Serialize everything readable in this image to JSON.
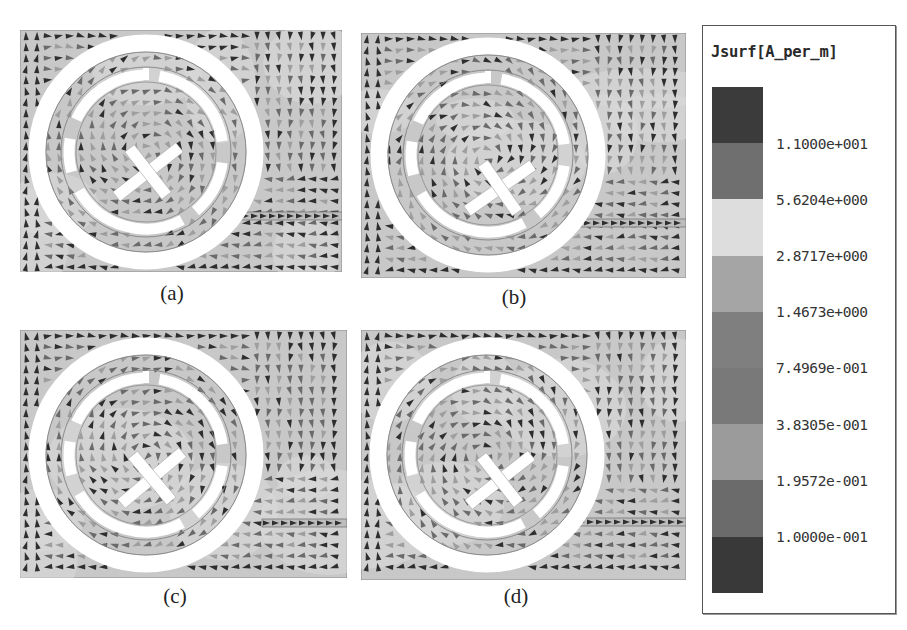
{
  "figure": {
    "panels": [
      {
        "id": "a",
        "caption": "(a)",
        "x": 20,
        "y": 30,
        "w": 322,
        "h": 242,
        "cx": 146,
        "cy": 152,
        "cross": [
          148,
          172
        ],
        "cross_angle": -38,
        "feed_y": 216,
        "feed_x0": 232,
        "gap_angle": 200
      },
      {
        "id": "b",
        "caption": "(b)",
        "x": 361,
        "y": 33,
        "w": 325,
        "h": 245,
        "cx": 488,
        "cy": 155,
        "cross": [
          500,
          188
        ],
        "cross_angle": -35,
        "feed_y": 223,
        "feed_x0": 565,
        "gap_angle": 200
      },
      {
        "id": "c",
        "caption": "(c)",
        "x": 20,
        "y": 330,
        "w": 327,
        "h": 248,
        "cx": 146,
        "cy": 455,
        "cross": [
          152,
          478
        ],
        "cross_angle": -40,
        "feed_y": 523,
        "feed_x0": 262,
        "gap_angle": 200
      },
      {
        "id": "d",
        "caption": "(d)",
        "x": 361,
        "y": 330,
        "w": 325,
        "h": 250,
        "cx": 487,
        "cy": 455,
        "cross": [
          500,
          480
        ],
        "cross_angle": -38,
        "feed_y": 522,
        "feed_x0": 568,
        "gap_angle": 200
      }
    ],
    "captions": {
      "a": "(a)",
      "b": "(b)",
      "c": "(c)",
      "d": "(d)"
    }
  },
  "legend": {
    "title": "Jsurf[A_per_m]",
    "quantity": "Surface current density",
    "unit": "A_per_m",
    "colors": [
      "#3b3b3b",
      "#6f6f6f",
      "#dddddd",
      "#a5a5a5",
      "#7f7f7f",
      "#797979",
      "#9b9b9b",
      "#6b6b6b",
      "#393939"
    ],
    "labels": [
      "1.1000e+001",
      "5.6204e+000",
      "2.8717e+000",
      "1.4673e+000",
      "7.4969e-001",
      "3.8305e-001",
      "1.9572e-001",
      "1.0000e-001"
    ]
  },
  "style": {
    "substrate": "#c8c8c8",
    "metal": "#ffffff",
    "arrow_dark": "#2e2e2e",
    "arrow_mid": "#6a6a6a",
    "arrow_light": "#9e9e9e",
    "outline": "#8a8a8a"
  }
}
